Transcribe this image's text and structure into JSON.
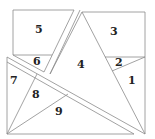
{
  "figure": {
    "line_color": "#8a8a8a",
    "label_color": "#222222",
    "regions": [
      {
        "id": "r1",
        "label": "1",
        "x": 128,
        "y": 84
      },
      {
        "id": "r2",
        "label": "2",
        "x": 115,
        "y": 66
      },
      {
        "id": "r3",
        "label": "3",
        "x": 112,
        "y": 35
      },
      {
        "id": "r4",
        "label": "4",
        "x": 79,
        "y": 68
      },
      {
        "id": "r5",
        "label": "5",
        "x": 37,
        "y": 33
      },
      {
        "id": "r6",
        "label": "6",
        "x": 35,
        "y": 65
      },
      {
        "id": "r7",
        "label": "7",
        "x": 13,
        "y": 84
      },
      {
        "id": "r8",
        "label": "8",
        "x": 34,
        "y": 98
      },
      {
        "id": "r9",
        "label": "9",
        "x": 57,
        "y": 115
      }
    ]
  }
}
